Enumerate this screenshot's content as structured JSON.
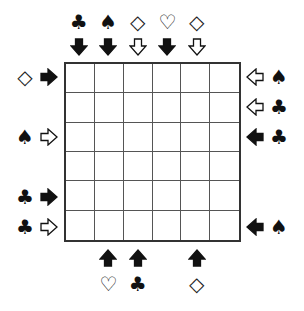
{
  "puzzle": {
    "grid": {
      "rows": 6,
      "cols": 6
    },
    "suit_glyphs": {
      "club": "♣",
      "spade": "♠",
      "diamond": "◇",
      "heart": "♡"
    },
    "top_clues": [
      {
        "col": 0,
        "suit": "club",
        "arrow": "filled"
      },
      {
        "col": 1,
        "suit": "spade",
        "arrow": "filled"
      },
      {
        "col": 2,
        "suit": "diamond",
        "arrow": "outline"
      },
      {
        "col": 3,
        "suit": "heart",
        "arrow": "filled"
      },
      {
        "col": 4,
        "suit": "diamond",
        "arrow": "outline"
      }
    ],
    "bottom_clues": [
      {
        "col": 1,
        "suit": "heart",
        "arrow": "filled"
      },
      {
        "col": 2,
        "suit": "club",
        "arrow": "filled"
      },
      {
        "col": 4,
        "suit": "diamond",
        "arrow": "filled"
      }
    ],
    "left_clues": [
      {
        "row": 0,
        "suit": "diamond",
        "arrow": "filled"
      },
      {
        "row": 2,
        "suit": "spade",
        "arrow": "outline"
      },
      {
        "row": 4,
        "suit": "club",
        "arrow": "filled"
      },
      {
        "row": 5,
        "suit": "club",
        "arrow": "outline"
      }
    ],
    "right_clues": [
      {
        "row": 0,
        "suit": "spade",
        "arrow": "outline"
      },
      {
        "row": 1,
        "suit": "club",
        "arrow": "outline"
      },
      {
        "row": 2,
        "suit": "club",
        "arrow": "filled"
      },
      {
        "row": 5,
        "suit": "spade",
        "arrow": "filled"
      }
    ]
  }
}
